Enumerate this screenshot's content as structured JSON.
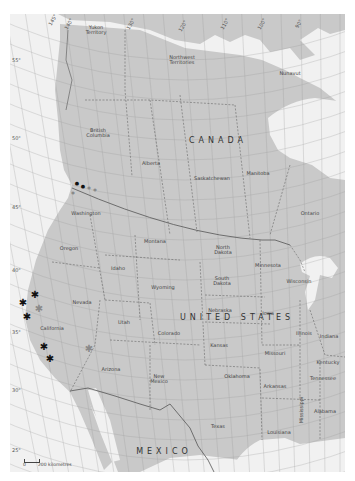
{
  "map": {
    "colors": {
      "land": "#c9c9c9",
      "water": "#f1f1f1",
      "grid": "#9a9a9a",
      "border": "#555555",
      "marker_dark": "#111111",
      "marker_grey": "#8a8a8a"
    },
    "countries": [
      {
        "name": "CANADA",
        "x": 218,
        "y": 141
      },
      {
        "name": "UNITED STATES",
        "x": 237,
        "y": 318
      },
      {
        "name": "MEXICO",
        "x": 164,
        "y": 452
      }
    ],
    "regions": [
      {
        "name": "Yukon\nTerritory",
        "x": 96,
        "y": 30
      },
      {
        "name": "Northwest\nTerritories",
        "x": 182,
        "y": 60
      },
      {
        "name": "Nunavut",
        "x": 290,
        "y": 73
      },
      {
        "name": "British\nColumbia",
        "x": 98,
        "y": 133
      },
      {
        "name": "Alberta",
        "x": 151,
        "y": 163
      },
      {
        "name": "Saskatchewan",
        "x": 212,
        "y": 178
      },
      {
        "name": "Manitoba",
        "x": 258,
        "y": 173
      },
      {
        "name": "Ontario",
        "x": 310,
        "y": 213
      },
      {
        "name": "Washington",
        "x": 86,
        "y": 213
      },
      {
        "name": "Oregon",
        "x": 69,
        "y": 248
      },
      {
        "name": "Montana",
        "x": 155,
        "y": 241
      },
      {
        "name": "North\nDakota",
        "x": 223,
        "y": 250
      },
      {
        "name": "Minnesota",
        "x": 268,
        "y": 265
      },
      {
        "name": "Wisconsin",
        "x": 299,
        "y": 281
      },
      {
        "name": "Idaho",
        "x": 118,
        "y": 268
      },
      {
        "name": "Wyoming",
        "x": 163,
        "y": 287
      },
      {
        "name": "South\nDakota",
        "x": 222,
        "y": 281
      },
      {
        "name": "Nevada",
        "x": 82,
        "y": 302
      },
      {
        "name": "Nebraska",
        "x": 220,
        "y": 310
      },
      {
        "name": "Iowa",
        "x": 268,
        "y": 313
      },
      {
        "name": "Utah",
        "x": 124,
        "y": 322
      },
      {
        "name": "Colorado",
        "x": 169,
        "y": 333
      },
      {
        "name": "Illinois",
        "x": 304,
        "y": 333
      },
      {
        "name": "Indiana",
        "x": 329,
        "y": 336
      },
      {
        "name": "California",
        "x": 52,
        "y": 328
      },
      {
        "name": "Kansas",
        "x": 219,
        "y": 345
      },
      {
        "name": "Missouri",
        "x": 275,
        "y": 353
      },
      {
        "name": "Kentucky",
        "x": 328,
        "y": 362
      },
      {
        "name": "Arizona",
        "x": 111,
        "y": 369
      },
      {
        "name": "New\nMexico",
        "x": 159,
        "y": 379
      },
      {
        "name": "Oklahoma",
        "x": 237,
        "y": 376
      },
      {
        "name": "Arkansas",
        "x": 275,
        "y": 386
      },
      {
        "name": "Tennessee",
        "x": 323,
        "y": 378
      },
      {
        "name": "Mississippi",
        "x": 301,
        "y": 410
      },
      {
        "name": "Alabama",
        "x": 325,
        "y": 411
      },
      {
        "name": "Texas",
        "x": 218,
        "y": 426
      },
      {
        "name": "Louisiana",
        "x": 279,
        "y": 432
      }
    ],
    "latitude_labels": [
      {
        "text": "55°",
        "x": 12,
        "y": 58
      },
      {
        "text": "50°",
        "x": 12,
        "y": 136
      },
      {
        "text": "45°",
        "x": 12,
        "y": 205
      },
      {
        "text": "40°",
        "x": 12,
        "y": 268
      },
      {
        "text": "35°",
        "x": 12,
        "y": 330
      },
      {
        "text": "30°",
        "x": 12,
        "y": 388
      },
      {
        "text": "25°",
        "x": 12,
        "y": 448
      }
    ],
    "longitude_labels": [
      {
        "text": "145°",
        "x": 53,
        "y": 20
      },
      {
        "text": "140°",
        "x": 69,
        "y": 24
      },
      {
        "text": "130°",
        "x": 131,
        "y": 24
      },
      {
        "text": "120°",
        "x": 183,
        "y": 26
      },
      {
        "text": "110°",
        "x": 225,
        "y": 24
      },
      {
        "text": "100°",
        "x": 262,
        "y": 24
      },
      {
        "text": "90°",
        "x": 299,
        "y": 24
      }
    ],
    "markers": [
      {
        "type": "dot",
        "tone": "dark",
        "x": 77,
        "y": 183
      },
      {
        "type": "dot",
        "tone": "dark",
        "x": 83,
        "y": 186
      },
      {
        "type": "dot",
        "tone": "grey",
        "x": 89,
        "y": 188
      },
      {
        "type": "dot",
        "tone": "grey",
        "x": 95,
        "y": 190
      },
      {
        "type": "dot",
        "tone": "grey",
        "x": 73,
        "y": 193
      },
      {
        "type": "star",
        "tone": "dark",
        "x": 35,
        "y": 295
      },
      {
        "type": "star",
        "tone": "dark",
        "x": 23,
        "y": 303
      },
      {
        "type": "star",
        "tone": "grey",
        "x": 39,
        "y": 309
      },
      {
        "type": "star",
        "tone": "dark",
        "x": 27,
        "y": 317
      },
      {
        "type": "star",
        "tone": "dark",
        "x": 44,
        "y": 347
      },
      {
        "type": "star",
        "tone": "dark",
        "x": 50,
        "y": 359
      },
      {
        "type": "star",
        "tone": "grey",
        "x": 89,
        "y": 349
      }
    ],
    "scale_bar": {
      "start": "0",
      "end_label": "200 kilometres",
      "x": 24,
      "y": 459
    }
  }
}
